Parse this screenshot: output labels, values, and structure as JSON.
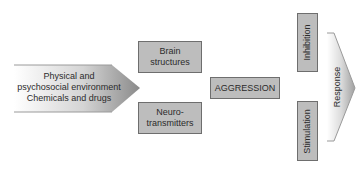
{
  "diagram": {
    "input_arrow": {
      "lines": [
        "Physical and",
        "psychosocial environment",
        "Chemicals and drugs"
      ]
    },
    "mediators": [
      {
        "label": "Brain structures",
        "lines": [
          "Brain",
          "structures"
        ]
      },
      {
        "label": "Neurotransmitters",
        "lines": [
          "Neuro-",
          "transmitters"
        ]
      }
    ],
    "center": {
      "label": "AGGRESSION"
    },
    "modulators": [
      {
        "label": "Inhibition"
      },
      {
        "label": "Stimulation"
      }
    ],
    "output_arrow": {
      "label": "Response"
    },
    "colors": {
      "box_fill": "#bdbdbd",
      "box_border": "#6e6e6e",
      "arrow_gradient_start": "#ffffff",
      "arrow_gradient_end": "#8a8a8a"
    }
  }
}
